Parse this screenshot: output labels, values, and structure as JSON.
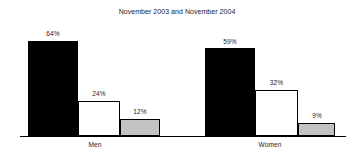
{
  "chart_data": {
    "type": "bar",
    "title": "November 2003 and November 2004",
    "xlabel": "",
    "ylabel": "",
    "ylim": [
      0,
      70
    ],
    "grid": false,
    "legend": "none",
    "categories": [
      "Men",
      "Women"
    ],
    "series": [
      {
        "name": "series-1",
        "color": "#000000",
        "style": "black-filled",
        "values": [
          64,
          59
        ],
        "labels": [
          "64%",
          "59%"
        ]
      },
      {
        "name": "series-2",
        "color": "#ffffff",
        "style": "white-outlined",
        "values": [
          24,
          32
        ],
        "labels": [
          "24%",
          "32%"
        ]
      },
      {
        "name": "series-3",
        "color": "#c2c2c2",
        "style": "gray-filled",
        "values": [
          12,
          9
        ],
        "labels": [
          "12%",
          "9%"
        ]
      }
    ],
    "bars": [
      {
        "id": "men-s1",
        "group": "Men",
        "series": "series-1",
        "value": 64,
        "label": "64%",
        "style": "black",
        "x": 28,
        "y": 41,
        "w": 50,
        "h": 95,
        "label_x": 28,
        "label_y": 30,
        "label_w": 50
      },
      {
        "id": "men-s2",
        "group": "Men",
        "series": "series-2",
        "value": 24,
        "label": "24%",
        "style": "white",
        "x": 78,
        "y": 101,
        "w": 42,
        "h": 35,
        "label_x": 75,
        "label_y": 90,
        "label_w": 48
      },
      {
        "id": "men-s3",
        "group": "Men",
        "series": "series-3",
        "value": 12,
        "label": "12%",
        "style": "gray",
        "x": 120,
        "y": 119,
        "w": 40,
        "h": 17,
        "label_x": 117,
        "label_y": 108,
        "label_w": 46
      },
      {
        "id": "women-s1",
        "group": "Women",
        "series": "series-1",
        "value": 59,
        "label": "59%",
        "style": "black",
        "x": 205,
        "y": 48,
        "w": 50,
        "h": 88,
        "label_x": 205,
        "label_y": 38,
        "label_w": 50
      },
      {
        "id": "women-s2",
        "group": "Women",
        "series": "series-2",
        "value": 32,
        "label": "32%",
        "style": "white",
        "x": 255,
        "y": 90,
        "w": 43,
        "h": 46,
        "label_x": 252,
        "label_y": 79,
        "label_w": 49
      },
      {
        "id": "women-s3",
        "group": "Women",
        "series": "series-3",
        "value": 9,
        "label": "9%",
        "style": "gray",
        "x": 298,
        "y": 123,
        "w": 37,
        "h": 13,
        "label_x": 296,
        "label_y": 112,
        "label_w": 42
      }
    ],
    "category_positions": [
      {
        "label": "Men",
        "x": 70,
        "w": 50
      },
      {
        "label": "Women",
        "x": 245,
        "w": 50
      }
    ],
    "axis": {
      "baseline_y": 136,
      "baseline_x": 20,
      "baseline_w": 326,
      "color": "#000000"
    }
  }
}
